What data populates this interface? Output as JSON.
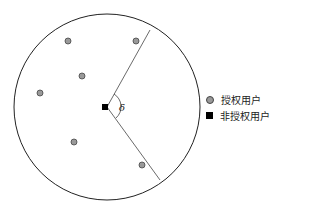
{
  "diagram": {
    "circle": {
      "cx": 107,
      "cy": 107,
      "r": 93
    },
    "center_marker": {
      "x": 105,
      "y": 107,
      "label": "非授权用户"
    },
    "angle_label": "δ",
    "sector_lines": [
      {
        "x1": 107,
        "y1": 107,
        "x2": 150,
        "y2": 30
      },
      {
        "x1": 107,
        "y1": 107,
        "x2": 160,
        "y2": 180
      }
    ],
    "authorized_users": [
      {
        "x": 68,
        "y": 41
      },
      {
        "x": 136,
        "y": 41
      },
      {
        "x": 82,
        "y": 76
      },
      {
        "x": 40,
        "y": 93
      },
      {
        "x": 74,
        "y": 142
      },
      {
        "x": 142,
        "y": 165
      }
    ]
  },
  "legend": {
    "items": [
      {
        "marker": "circle-gray",
        "label": "授权用户"
      },
      {
        "marker": "square-black",
        "label": "非授权用户"
      }
    ]
  }
}
